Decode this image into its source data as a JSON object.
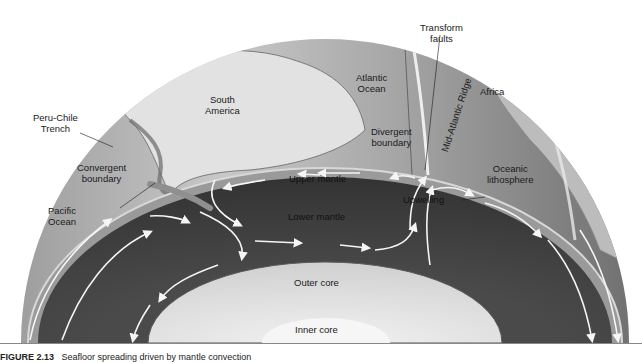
{
  "figure": {
    "caption_number": "FIGURE 2.13",
    "caption_text": "Seafloor spreading driven by mantle convection"
  },
  "labels": {
    "transform_faults": "Transform\nfaults",
    "atlantic_ocean": "Atlantic\nOcean",
    "africa": "Africa",
    "south_america": "South\nAmerica",
    "mid_atlantic_ridge": "Mid-Atlantic Ridge",
    "peru_chile_trench": "Peru-Chile\nTrench",
    "divergent_boundary": "Divergent\nboundary",
    "oceanic_lithosphere": "Oceanic\nlithosphere",
    "convergent_boundary": "Convergent\nboundary",
    "upper_mantle": "Upper mantle",
    "pacific_ocean": "Pacific\nOcean",
    "upwelling": "Upwelling",
    "lower_mantle": "Lower mantle",
    "outer_core": "Outer core",
    "inner_core": "Inner core"
  },
  "colors": {
    "globe_surface": "#b4b4b4",
    "continent": "#d9d9d9",
    "lithosphere": "#8f8f8f",
    "mantle": "#3d3d3d",
    "outer_core": "#dcdcdc",
    "inner_core": "#f4f4f4",
    "arrows": "#f5f5f5"
  }
}
